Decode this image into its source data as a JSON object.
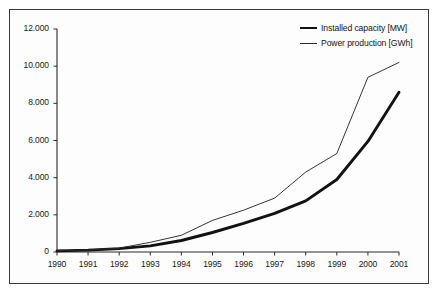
{
  "chart_data": {
    "type": "line",
    "title": "",
    "subtitle": "",
    "xlabel": "",
    "ylabel": "",
    "x": [
      1990,
      1991,
      1992,
      1993,
      1994,
      1995,
      1996,
      1997,
      1998,
      1999,
      2000,
      2001
    ],
    "categories": [
      "1990",
      "1991",
      "1992",
      "1993",
      "1994",
      "1995",
      "1996",
      "1997",
      "1998",
      "1999",
      "2000",
      "2001"
    ],
    "series": [
      {
        "name": "Installed capacity [MW]",
        "style": "thick",
        "color": "#121212",
        "values": [
          60,
          100,
          180,
          330,
          620,
          1050,
          1540,
          2080,
          2750,
          3900,
          5950,
          8600
        ]
      },
      {
        "name": "Power production [GWh]",
        "style": "thin",
        "color": "#2a2a2a",
        "values": [
          60,
          110,
          210,
          520,
          900,
          1700,
          2250,
          2900,
          4300,
          5300,
          9400,
          10200
        ]
      }
    ],
    "xlim": [
      1990,
      2001
    ],
    "ylim": [
      0,
      12000
    ],
    "yticks": [
      0,
      2000,
      4000,
      6000,
      8000,
      10000,
      12000
    ],
    "ytick_labels": [
      "0",
      "2.000",
      "4.000",
      "6.000",
      "8.000",
      "10.000",
      "12.000"
    ],
    "xtick_labels": [
      "1990",
      "1991",
      "1992",
      "1993",
      "1994",
      "1995",
      "1996",
      "1997",
      "1998",
      "1999",
      "2000",
      "2001"
    ],
    "grid": false,
    "legend_position": "top-right",
    "legend": [
      "Installed capacity [MW]",
      "Power production [GWh]"
    ],
    "axis_color": "#2a2a2a",
    "background_color": "#fdfdfd",
    "frame_color": "#3b3b3b"
  }
}
